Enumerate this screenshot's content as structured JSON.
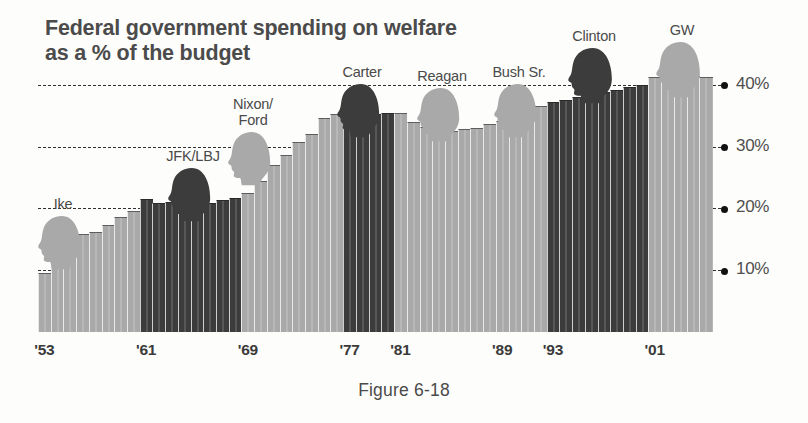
{
  "figure": {
    "title_line1": "Federal government spending on welfare",
    "title_line2": "as a % of the budget",
    "caption": "Figure 6-18"
  },
  "colors": {
    "republican_bar": "#a9a9a9",
    "democrat_bar": "#3c3c3c",
    "gridline": "#2e2e2e",
    "text": "#4a4a4a",
    "background": "#fdfdfb"
  },
  "presidents": [
    {
      "name": "Ike",
      "name_line2": "",
      "party": "rep",
      "silhouette": "president-head-silhouette",
      "x": 63,
      "label_top": 196,
      "head_top": 214,
      "head_w": 52,
      "head_h": 58
    },
    {
      "name": "JFK/LBJ",
      "name_line2": "",
      "party": "dem",
      "silhouette": "president-head-silhouette",
      "x": 193,
      "label_top": 148,
      "head_top": 166,
      "head_w": 52,
      "head_h": 58
    },
    {
      "name": "Nixon/",
      "name_line2": "Ford",
      "party": "rep",
      "silhouette": "president-head-silhouette",
      "x": 253,
      "label_top": 96,
      "head_top": 130,
      "head_w": 52,
      "head_h": 58
    },
    {
      "name": "Carter",
      "name_line2": "",
      "party": "dem",
      "silhouette": "president-head-silhouette",
      "x": 362,
      "label_top": 64,
      "head_top": 82,
      "head_w": 52,
      "head_h": 58
    },
    {
      "name": "Reagan",
      "name_line2": "",
      "party": "rep",
      "silhouette": "president-head-silhouette",
      "x": 442,
      "label_top": 68,
      "head_top": 86,
      "head_w": 52,
      "head_h": 58
    },
    {
      "name": "Bush Sr.",
      "name_line2": "",
      "party": "rep",
      "silhouette": "president-head-silhouette",
      "x": 519,
      "label_top": 64,
      "head_top": 82,
      "head_w": 52,
      "head_h": 58
    },
    {
      "name": "Clinton",
      "name_line2": "",
      "party": "dem",
      "silhouette": "president-head-silhouette",
      "x": 594,
      "label_top": 28,
      "head_top": 46,
      "head_w": 54,
      "head_h": 60
    },
    {
      "name": "GW",
      "name_line2": "",
      "party": "rep",
      "silhouette": "president-head-silhouette",
      "x": 682,
      "label_top": 22,
      "head_top": 40,
      "head_w": 54,
      "head_h": 60
    }
  ],
  "chart_data": {
    "type": "bar",
    "title": "Federal government spending on welfare as a % of the budget",
    "xlabel": "",
    "ylabel": "% of the budget",
    "ylim": [
      0,
      44
    ],
    "yticks": [
      10,
      20,
      30,
      40
    ],
    "ytick_labels": [
      "10%",
      "20%",
      "30%",
      "40%"
    ],
    "grid": true,
    "legend_position": "none",
    "xtick_labels": [
      "'53",
      "'61",
      "'69",
      "'77",
      "'81",
      "'89",
      "'93",
      "'01"
    ],
    "xtick_years": [
      1953,
      1961,
      1969,
      1977,
      1981,
      1989,
      1993,
      2001
    ],
    "series_name": "Welfare spending share of federal budget",
    "categories": [
      1953,
      1954,
      1955,
      1956,
      1957,
      1958,
      1959,
      1960,
      1961,
      1962,
      1963,
      1964,
      1965,
      1966,
      1967,
      1968,
      1969,
      1970,
      1971,
      1972,
      1973,
      1974,
      1975,
      1976,
      1977,
      1978,
      1979,
      1980,
      1981,
      1982,
      1983,
      1984,
      1985,
      1986,
      1987,
      1988,
      1989,
      1990,
      1991,
      1992,
      1993,
      1994,
      1995,
      1996,
      1997,
      1998,
      1999,
      2000,
      2001,
      2002,
      2003,
      2004,
      2005
    ],
    "values": [
      9.5,
      14.2,
      15.0,
      15.8,
      16.2,
      17.3,
      18.6,
      19.6,
      21.5,
      20.8,
      21.0,
      21.2,
      21.0,
      20.8,
      21.3,
      21.6,
      22.5,
      24.5,
      27.0,
      28.6,
      30.8,
      32.0,
      34.6,
      35.2,
      35.0,
      35.0,
      35.2,
      35.4,
      35.5,
      34.0,
      33.2,
      32.3,
      32.5,
      32.8,
      33.0,
      33.6,
      34.2,
      34.6,
      35.8,
      36.6,
      37.2,
      37.5,
      38.0,
      38.3,
      38.9,
      39.2,
      39.6,
      40.0,
      41.2,
      40.6,
      40.8,
      41.4,
      41.3
    ],
    "bar_party": [
      "rep",
      "rep",
      "rep",
      "rep",
      "rep",
      "rep",
      "rep",
      "rep",
      "dem",
      "dem",
      "dem",
      "dem",
      "dem",
      "dem",
      "dem",
      "dem",
      "rep",
      "rep",
      "rep",
      "rep",
      "rep",
      "rep",
      "rep",
      "rep",
      "dem",
      "dem",
      "dem",
      "dem",
      "rep",
      "rep",
      "rep",
      "rep",
      "rep",
      "rep",
      "rep",
      "rep",
      "rep",
      "rep",
      "rep",
      "rep",
      "dem",
      "dem",
      "dem",
      "dem",
      "dem",
      "dem",
      "dem",
      "dem",
      "rep",
      "rep",
      "rep",
      "rep",
      "rep"
    ]
  }
}
